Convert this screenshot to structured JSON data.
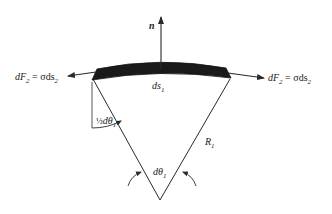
{
  "diagram": {
    "type": "surface-tension-membrane-element",
    "labels": {
      "normal": "n",
      "force_left_lhs": "dF",
      "force_left_sub": "2",
      "force_left_eq": " = σds",
      "force_left_eq_sub": "2",
      "force_right_lhs": "dF",
      "force_right_sub": "2",
      "force_right_eq": " = σds",
      "force_right_eq_sub": "2",
      "arc_length": "ds",
      "arc_length_sub": "1",
      "half_angle_frac": "½",
      "half_angle": "dθ",
      "half_angle_sub": "1",
      "angle": "dθ",
      "angle_sub": "1",
      "radius": "R",
      "radius_sub": "1"
    },
    "colors": {
      "line": "#2a2a2a",
      "membrane": "#1a1a1a",
      "background": "#ffffff"
    }
  }
}
